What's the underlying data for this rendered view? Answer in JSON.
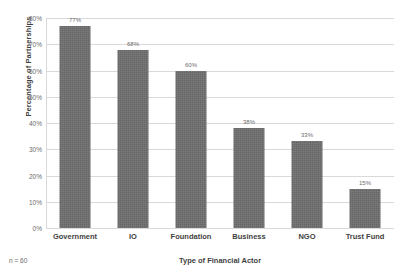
{
  "chart_data": {
    "type": "bar",
    "title": "",
    "subtitle": "",
    "categories": [
      "Government",
      "IO",
      "Foundation",
      "Business",
      "NGO",
      "Trust Fund"
    ],
    "values": [
      77,
      68,
      60,
      38,
      33,
      15
    ],
    "value_labels": [
      "77%",
      "68%",
      "60%",
      "38%",
      "33%",
      "15%"
    ],
    "series": [
      {
        "name": "Percentage of Partnerships",
        "values": [
          77,
          68,
          60,
          38,
          33,
          15
        ]
      }
    ],
    "xlabel": "Type of Financial Actor",
    "ylabel": "Percentage of Partnerships",
    "ylim": [
      0,
      80
    ],
    "ytick_values": [
      0,
      10,
      20,
      30,
      40,
      50,
      60,
      70,
      80
    ],
    "ytick_labels": [
      "0%",
      "10%",
      "20%",
      "30%",
      "40%",
      "50%",
      "60%",
      "70%",
      "80%"
    ],
    "grid": true,
    "grid_axis": "y",
    "legend": false,
    "legend_position": "none",
    "annotations": [
      "n = 60"
    ],
    "bar_color": "#6e6e6e",
    "gridline_color": "#d9d9d9",
    "text_color": "#3f3f3f",
    "tick_label_color": "#6b6b6b",
    "background_color": "#ffffff"
  },
  "footnote": {
    "sample_size": "n = 60"
  },
  "axes": {
    "x_title": "Type of Financial Actor",
    "y_title": "Percentage of Partnerships"
  }
}
